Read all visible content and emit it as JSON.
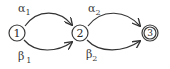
{
  "diagram": {
    "type": "finite-state-automaton",
    "nodes": [
      {
        "id": "1",
        "label": "1",
        "accepting": false
      },
      {
        "id": "2",
        "label": "2",
        "accepting": false
      },
      {
        "id": "3",
        "label": "3",
        "accepting": true
      }
    ],
    "edges": [
      {
        "from": "1",
        "to": "2",
        "symbol": "α",
        "subscript": "1",
        "curve": "top"
      },
      {
        "from": "1",
        "to": "2",
        "symbol": "β",
        "subscript": "1",
        "curve": "bottom"
      },
      {
        "from": "2",
        "to": "3",
        "symbol": "α",
        "subscript": "2",
        "curve": "top"
      },
      {
        "from": "2",
        "to": "3",
        "symbol": "β",
        "subscript": "2",
        "curve": "bottom"
      }
    ],
    "colors": {
      "stroke": "#333333",
      "text": "#2a2a2a",
      "background": "#ffffff"
    }
  }
}
